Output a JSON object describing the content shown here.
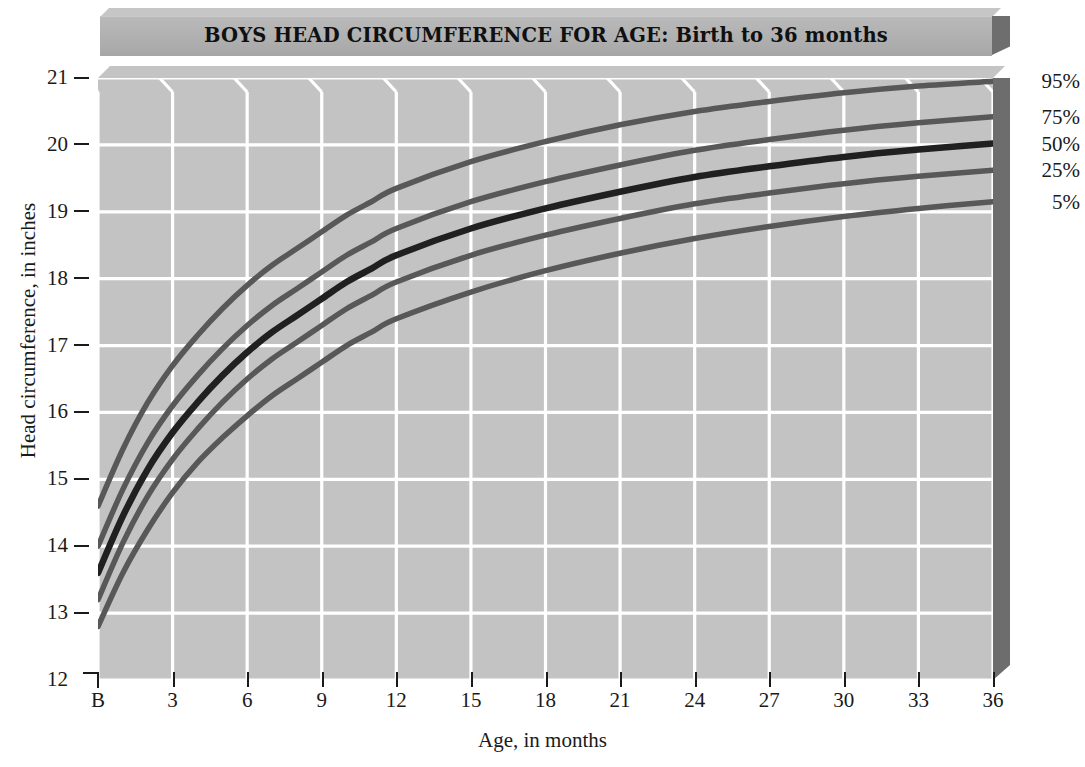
{
  "title": "BOYS HEAD CIRCUMFERENCE FOR AGE: Birth to 36 months",
  "axes": {
    "ylabel": "Head circumference, in inches",
    "xlabel": "Age, in months",
    "yticks": [
      "21",
      "20",
      "19",
      "18",
      "17",
      "16",
      "15",
      "14",
      "13",
      "12"
    ],
    "xticks": [
      "B",
      "3",
      "6",
      "9",
      "12",
      "15",
      "18",
      "21",
      "24",
      "27",
      "30",
      "33",
      "36"
    ]
  },
  "legend": [
    "95%",
    "75%",
    "50%",
    "25%",
    "5%"
  ],
  "colors": {
    "plot_background": "#c3c3c3",
    "gridline": "#ffffff",
    "curve_major": "#202020",
    "curve_minor": "#585858",
    "panel_side": "#6d6d6d",
    "title_face": "#b0b0b0"
  },
  "chart_data": {
    "type": "line",
    "title": "BOYS HEAD CIRCUMFERENCE FOR AGE: Birth to 36 months",
    "xlabel": "Age, in months",
    "ylabel": "Head circumference, in inches",
    "xlim": [
      0,
      36
    ],
    "ylim": [
      12,
      21
    ],
    "grid": true,
    "legend_position": "right",
    "x": [
      0,
      1,
      2,
      3,
      4,
      5,
      6,
      7,
      8,
      9,
      10,
      11,
      12,
      15,
      18,
      21,
      24,
      27,
      30,
      33,
      36
    ],
    "series": [
      {
        "name": "95%",
        "values": [
          14.6,
          15.45,
          16.15,
          16.7,
          17.15,
          17.55,
          17.9,
          18.2,
          18.45,
          18.7,
          18.95,
          19.15,
          19.35,
          19.75,
          20.05,
          20.3,
          20.5,
          20.65,
          20.78,
          20.88,
          20.95
        ]
      },
      {
        "name": "75%",
        "values": [
          14.0,
          14.85,
          15.55,
          16.1,
          16.55,
          16.95,
          17.3,
          17.6,
          17.85,
          18.1,
          18.35,
          18.55,
          18.75,
          19.15,
          19.45,
          19.7,
          19.92,
          20.08,
          20.22,
          20.33,
          20.42
        ]
      },
      {
        "name": "50%",
        "values": [
          13.6,
          14.45,
          15.15,
          15.7,
          16.15,
          16.55,
          16.9,
          17.2,
          17.45,
          17.7,
          17.95,
          18.15,
          18.35,
          18.75,
          19.05,
          19.3,
          19.52,
          19.68,
          19.82,
          19.93,
          20.02
        ]
      },
      {
        "name": "25%",
        "values": [
          13.2,
          14.05,
          14.75,
          15.3,
          15.75,
          16.15,
          16.5,
          16.8,
          17.05,
          17.3,
          17.55,
          17.75,
          17.95,
          18.35,
          18.65,
          18.9,
          19.12,
          19.28,
          19.42,
          19.53,
          19.62
        ]
      },
      {
        "name": "5%",
        "values": [
          12.8,
          13.6,
          14.25,
          14.8,
          15.25,
          15.62,
          15.95,
          16.25,
          16.5,
          16.75,
          17.0,
          17.2,
          17.4,
          17.8,
          18.12,
          18.38,
          18.6,
          18.78,
          18.93,
          19.05,
          19.15
        ]
      }
    ]
  }
}
